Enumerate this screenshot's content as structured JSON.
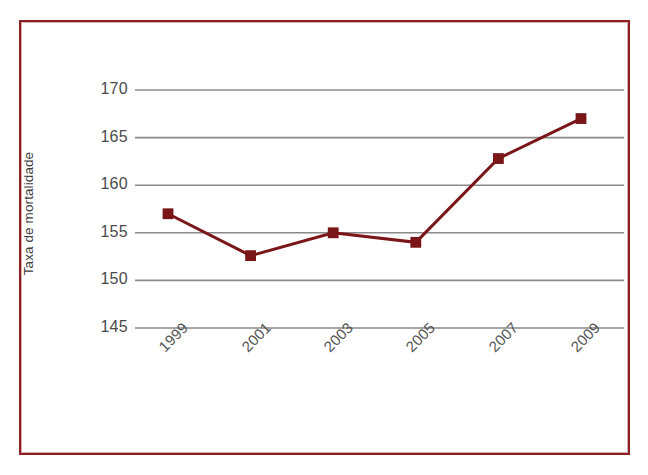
{
  "figure": {
    "frame_color": "#8c1d22",
    "background_color": "#ffffff",
    "gridline_color": "#8a8a8a",
    "series_color": "#7a1518"
  },
  "axis": {
    "y_title": "Taxa de mortalidade",
    "y_ticks": [
      "145",
      "150",
      "155",
      "160",
      "165",
      "170"
    ],
    "x_ticks": [
      "1999",
      "2001",
      "2003",
      "2005",
      "2007",
      "2009"
    ]
  },
  "chart_data": {
    "type": "line",
    "title": "",
    "subtitle": "",
    "xlabel": "",
    "ylabel": "Taxa de mortalidade",
    "categories": [
      "1999",
      "2001",
      "2003",
      "2005",
      "2007",
      "2009"
    ],
    "x": [
      1999,
      2001,
      2003,
      2005,
      2007,
      2009
    ],
    "values": [
      157.0,
      152.6,
      155.0,
      154.0,
      162.8,
      167.0
    ],
    "series": [
      {
        "name": "Taxa de mortalidade",
        "values": [
          157.0,
          152.6,
          155.0,
          154.0,
          162.8,
          167.0
        ],
        "color": "#7a1518",
        "marker": "square",
        "line_width": 3
      }
    ],
    "ylim": [
      143.5,
      171.5
    ],
    "ytick_values": [
      145,
      150,
      155,
      160,
      165,
      170
    ],
    "xtick_labels": [
      "1999",
      "2001",
      "2003",
      "2005",
      "2007",
      "2009"
    ],
    "xtick_rotation": -45,
    "grid": {
      "horizontal": true,
      "vertical": false,
      "color": "#8a8a8a"
    },
    "legend": {
      "visible": false,
      "position": "none"
    },
    "annotations": []
  },
  "caption": {
    "partial_text": ""
  }
}
